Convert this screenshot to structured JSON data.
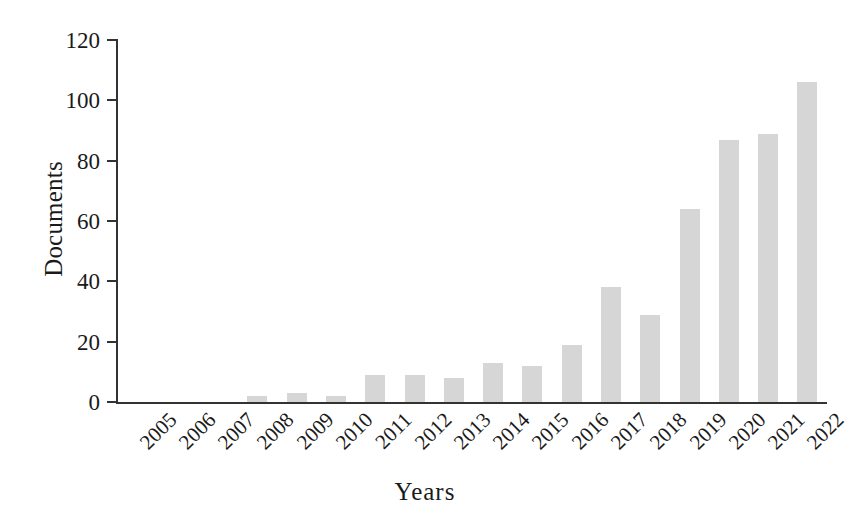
{
  "chart_data": {
    "type": "bar",
    "title": "",
    "subtitle": "",
    "xlabel": "Years",
    "ylabel": "Documents",
    "categories": [
      "2005",
      "2006",
      "2007",
      "2008",
      "2009",
      "2010",
      "2011",
      "2012",
      "2013",
      "2014",
      "2015",
      "2016",
      "2017",
      "2018",
      "2019",
      "2020",
      "2021",
      "2022"
    ],
    "values": [
      0,
      0,
      0,
      2,
      3,
      2,
      9,
      9,
      8,
      13,
      12,
      19,
      38,
      29,
      64,
      87,
      89,
      106
    ],
    "series": [
      {
        "name": "Documents",
        "values": [
          0,
          0,
          0,
          2,
          3,
          2,
          9,
          9,
          8,
          13,
          12,
          19,
          38,
          29,
          64,
          87,
          89,
          106
        ]
      }
    ],
    "ylim": [
      0,
      120
    ],
    "yticks": [
      0,
      20,
      40,
      60,
      80,
      100,
      120
    ],
    "ytick_labels": [
      "0",
      "20",
      "40",
      "60",
      "80",
      "100",
      "120"
    ],
    "grid": false,
    "legend": "none",
    "bar_color": "#d6d6d6",
    "axis_color": "#333333",
    "text_color": "#1a1a1a",
    "background_color": "#ffffff",
    "xtick_rotation": 45
  },
  "axes": {
    "y_title": "Documents",
    "x_title": "Years"
  }
}
